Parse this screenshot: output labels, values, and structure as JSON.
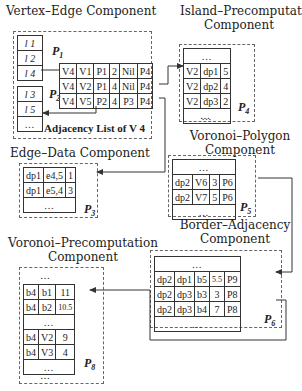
{
  "components": {
    "vertex_edge": {
      "title": "Vertex–Edge Component",
      "caption": "Adjacency List of V 4",
      "page1": {
        "label": "P",
        "sub": "1",
        "rows": [
          "l 1",
          "l 2",
          "l 4"
        ]
      },
      "page2": {
        "label": "P",
        "sub": "2",
        "rows": [
          "l 3",
          "l 5",
          "…"
        ]
      },
      "adjacency_rows": [
        [
          "V4",
          "V1",
          "P1",
          "2",
          "Nil",
          "P4"
        ],
        [
          "V4",
          "V2",
          "P1",
          "4",
          "Nil",
          "P4"
        ],
        [
          "V4",
          "V5",
          "P2",
          "4",
          "P3",
          "P4"
        ]
      ]
    },
    "island_precomputation": {
      "title_line1": "Island–Precomputation",
      "title_line2": "Component",
      "page": {
        "label": "P",
        "sub": "4"
      },
      "top": "…",
      "rows": [
        [
          "V2",
          "dp1",
          "5"
        ],
        [
          "V2",
          "dp2",
          "4"
        ],
        [
          "V2",
          "dp3",
          "2"
        ]
      ],
      "bottom": "…",
      "below": "…"
    },
    "edge_data": {
      "title": "Edge–Data Component",
      "page": {
        "label": "P",
        "sub": "3"
      },
      "rows": [
        [
          "dp1",
          "e4,5",
          "1"
        ],
        [
          "dp1",
          "e5,4",
          "3"
        ]
      ],
      "bottom": "…"
    },
    "voronoi_polygon": {
      "title_line1": "Voronoi–Polygon",
      "title_line2": "Component",
      "page": {
        "label": "P",
        "sub": "5"
      },
      "top": "…",
      "rows": [
        [
          "dp2",
          "V6",
          "3",
          "P6"
        ],
        [
          "dp2",
          "V7",
          "5",
          "P6"
        ]
      ],
      "bottom": "…"
    },
    "border_adjacency": {
      "title_line1": "Border–Adjacency",
      "title_line2": "Component",
      "page": {
        "label": "P",
        "sub": "6"
      },
      "top": "…",
      "rows": [
        [
          "dp2",
          "dp1",
          "b5",
          "5.5",
          "P9"
        ],
        [
          "dp2",
          "dp3",
          "b3",
          "3",
          "P8"
        ],
        [
          "dp2",
          "dp3",
          "b4",
          "7",
          "P8"
        ]
      ],
      "bottom": "…"
    },
    "voronoi_precomputation": {
      "title_line1": "Voronoi–Precomputation",
      "title_line2": "Component",
      "page": {
        "label": "P",
        "sub": "8"
      },
      "above": "…",
      "rows_a": [
        [
          "b4",
          "b1",
          "11"
        ],
        [
          "b4",
          "b2",
          "10.5"
        ]
      ],
      "middle": "…",
      "rows_b": [
        [
          "b4",
          "V2",
          "9"
        ],
        [
          "b4",
          "V3",
          "4"
        ]
      ],
      "bottom": "…",
      "below": "…"
    }
  },
  "colors": {
    "line": "#333333",
    "dashed_border": "#666666",
    "background": "#ffffff"
  }
}
